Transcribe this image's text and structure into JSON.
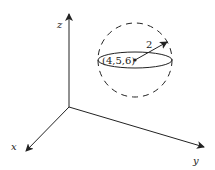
{
  "diagram": {
    "axes": {
      "x_label": "x",
      "y_label": "y",
      "z_label": "z"
    },
    "sphere": {
      "center_label": "(4,5,6)",
      "radius_label": "2",
      "style": "dashed"
    },
    "colors": {
      "stroke": "#222222",
      "background": "#ffffff"
    }
  }
}
